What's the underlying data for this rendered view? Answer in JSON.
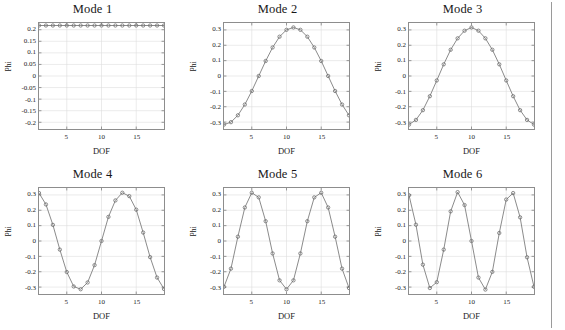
{
  "figure": {
    "rows": 2,
    "columns": 3,
    "axis_label_x": "DOF",
    "axis_label_y": "Phi",
    "line_color": "#7c7c7c",
    "marker_color": "#6d6d6d",
    "grid_color": "#dcdcdc",
    "axis_box_color": "#8d8d8d",
    "background": "#ffffff"
  },
  "chart_data": [
    {
      "type": "line",
      "title": "Mode 1",
      "xlabel": "DOF",
      "ylabel": "Phi",
      "xlim": [
        1,
        19
      ],
      "ylim": [
        -0.229,
        0.229
      ],
      "xticks": [
        5,
        10,
        15
      ],
      "yticks": [
        0.2,
        0.15,
        0.1,
        0.05,
        0,
        -0.05,
        -0.1,
        -0.15,
        -0.2
      ],
      "ytick_labels": [
        "0.2",
        "0.15",
        "0.1",
        "0.05",
        "0",
        "-0.05",
        "-0.1",
        "-0.15",
        "-0.2"
      ],
      "xtick_labels": [
        "5",
        "10",
        "15"
      ],
      "grid": true,
      "legend": "none",
      "marker": "circle",
      "x": [
        1,
        2,
        3,
        4,
        5,
        6,
        7,
        8,
        9,
        10,
        11,
        12,
        13,
        14,
        15,
        16,
        17,
        18,
        19
      ],
      "values": [
        0.2182,
        0.2182,
        0.2182,
        0.2182,
        0.2182,
        0.2182,
        0.2182,
        0.2182,
        0.2182,
        0.2182,
        0.2182,
        0.2182,
        0.2182,
        0.2182,
        0.2182,
        0.2182,
        0.2182,
        0.2182,
        0.2182
      ]
    },
    {
      "type": "line",
      "title": "Mode 2",
      "xlabel": "DOF",
      "ylabel": "Phi",
      "xlim": [
        1,
        19
      ],
      "ylim": [
        -0.345,
        0.345
      ],
      "xticks": [
        5,
        10,
        15
      ],
      "yticks": [
        0.3,
        0.2,
        0.1,
        0,
        -0.1,
        -0.2,
        -0.3
      ],
      "ytick_labels": [
        "0.3",
        "0.2",
        "0.1",
        "0",
        "-0.1",
        "-0.2",
        "-0.3"
      ],
      "xtick_labels": [
        "5",
        "10",
        "15"
      ],
      "grid": true,
      "legend": "none",
      "marker": "circle",
      "x": [
        1,
        2,
        3,
        4,
        5,
        6,
        7,
        8,
        9,
        10,
        11,
        12,
        13,
        14,
        15,
        16,
        17,
        18,
        19
      ],
      "values": [
        -0.3162,
        -0.3006,
        -0.2558,
        -0.1858,
        -0.0977,
        0.0,
        0.0977,
        0.1858,
        0.2558,
        0.3006,
        0.3162,
        0.3006,
        0.2558,
        0.1858,
        0.0977,
        0.0,
        -0.0977,
        -0.1858,
        -0.2558
      ]
    },
    {
      "type": "line",
      "title": "Mode 3",
      "xlabel": "DOF",
      "ylabel": "Phi",
      "xlim": [
        1,
        19
      ],
      "ylim": [
        -0.345,
        0.345
      ],
      "xticks": [
        5,
        10,
        15
      ],
      "yticks": [
        0.3,
        0.2,
        0.1,
        0,
        -0.1,
        -0.2,
        -0.3
      ],
      "ytick_labels": [
        "0.3",
        "0.2",
        "0.1",
        "0",
        "-0.1",
        "-0.2",
        "-0.3"
      ],
      "xtick_labels": [
        "5",
        "10",
        "15"
      ],
      "grid": true,
      "legend": "none",
      "marker": "circle",
      "x": [
        1,
        2,
        3,
        4,
        5,
        6,
        7,
        8,
        9,
        10,
        11,
        12,
        13,
        14,
        15,
        16,
        17,
        18,
        19
      ],
      "values": [
        -0.3162,
        -0.2858,
        -0.2225,
        -0.1316,
        -0.029,
        0.076,
        0.1708,
        0.2452,
        0.2948,
        0.3162,
        0.2948,
        0.2452,
        0.1708,
        0.076,
        -0.029,
        -0.1316,
        -0.2225,
        -0.2858,
        -0.3162
      ]
    },
    {
      "type": "line",
      "title": "Mode 4",
      "xlabel": "DOF",
      "ylabel": "Phi",
      "xlim": [
        1,
        19
      ],
      "ylim": [
        -0.345,
        0.345
      ],
      "xticks": [
        5,
        10,
        15
      ],
      "yticks": [
        0.3,
        0.2,
        0.1,
        0,
        -0.1,
        -0.2,
        -0.3
      ],
      "ytick_labels": [
        "0.3",
        "0.2",
        "0.1",
        "0",
        "-0.1",
        "-0.2",
        "-0.3"
      ],
      "xtick_labels": [
        "5",
        "10",
        "15"
      ],
      "grid": true,
      "legend": "none",
      "marker": "circle",
      "x": [
        1,
        2,
        3,
        4,
        5,
        6,
        7,
        8,
        9,
        10,
        11,
        12,
        13,
        14,
        15,
        16,
        17,
        18,
        19
      ],
      "values": [
        0.312,
        0.238,
        0.105,
        -0.056,
        -0.202,
        -0.296,
        -0.314,
        -0.27,
        -0.157,
        0.0,
        0.157,
        0.264,
        0.314,
        0.292,
        0.204,
        0.055,
        -0.105,
        -0.238,
        -0.312
      ]
    },
    {
      "type": "line",
      "title": "Mode 5",
      "xlabel": "DOF",
      "ylabel": "Phi",
      "xlim": [
        1,
        19
      ],
      "ylim": [
        -0.345,
        0.345
      ],
      "xticks": [
        5,
        10,
        15
      ],
      "yticks": [
        0.3,
        0.2,
        0.1,
        0,
        -0.1,
        -0.2,
        -0.3
      ],
      "ytick_labels": [
        "0.3",
        "0.2",
        "0.1",
        "0",
        "-0.1",
        "-0.2",
        "-0.3"
      ],
      "xtick_labels": [
        "5",
        "10",
        "15"
      ],
      "grid": true,
      "legend": "none",
      "marker": "circle",
      "x": [
        1,
        2,
        3,
        4,
        5,
        6,
        7,
        8,
        9,
        10,
        11,
        12,
        13,
        14,
        15,
        16,
        17,
        18,
        19
      ],
      "values": [
        -0.298,
        -0.18,
        0.028,
        0.218,
        0.314,
        0.284,
        0.129,
        -0.081,
        -0.256,
        -0.314,
        -0.256,
        -0.081,
        0.129,
        0.284,
        0.314,
        0.218,
        0.028,
        -0.18,
        -0.306
      ]
    },
    {
      "type": "line",
      "title": "Mode 6",
      "xlabel": "DOF",
      "ylabel": "Phi",
      "xlim": [
        1,
        19
      ],
      "ylim": [
        -0.345,
        0.345
      ],
      "xticks": [
        5,
        10,
        15
      ],
      "yticks": [
        0.3,
        0.2,
        0.1,
        0,
        -0.1,
        -0.2,
        -0.3
      ],
      "ytick_labels": [
        "0.3",
        "0.2",
        "0.1",
        "0",
        "-0.1",
        "-0.2",
        "-0.3"
      ],
      "xtick_labels": [
        "5",
        "10",
        "15"
      ],
      "grid": true,
      "legend": "none",
      "marker": "circle",
      "x": [
        1,
        2,
        3,
        4,
        5,
        6,
        7,
        8,
        9,
        10,
        11,
        12,
        13,
        14,
        15,
        16,
        17,
        18,
        19
      ],
      "values": [
        0.298,
        0.106,
        -0.154,
        -0.306,
        -0.268,
        -0.056,
        0.193,
        0.318,
        0.234,
        0.0,
        -0.238,
        -0.316,
        -0.201,
        0.052,
        0.27,
        0.312,
        0.154,
        -0.106,
        -0.298
      ]
    }
  ]
}
